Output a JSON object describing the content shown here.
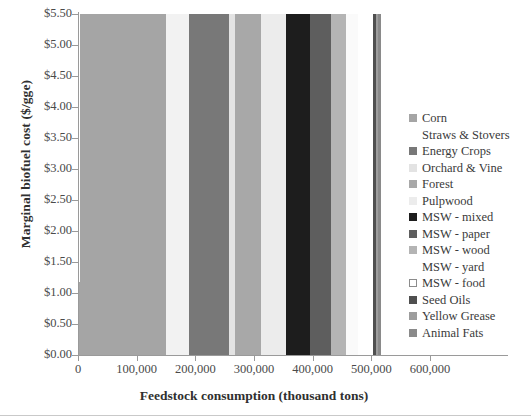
{
  "chart_data": {
    "type": "area",
    "title": "",
    "xlabel": "Feedstock consumption (thousand tons)",
    "ylabel": "Marginal biofuel cost ($/gge)",
    "xlim": [
      0,
      600000
    ],
    "ylim": [
      0.0,
      5.5
    ],
    "xticks": [
      "0",
      "100,000",
      "200,000",
      "300,000",
      "400,000",
      "500,000",
      "600,000"
    ],
    "xtick_values": [
      0,
      100000,
      200000,
      300000,
      400000,
      500000,
      600000
    ],
    "yticks": [
      "$0.00",
      "$0.50",
      "$1.00",
      "$1.50",
      "$2.00",
      "$2.50",
      "$3.00",
      "$3.50",
      "$4.00",
      "$4.50",
      "$5.00",
      "$5.50"
    ],
    "ytick_values": [
      0.0,
      0.5,
      1.0,
      1.5,
      2.0,
      2.5,
      3.0,
      3.5,
      4.0,
      4.5,
      5.0,
      5.5
    ],
    "grid": false,
    "legend_position": "right",
    "series": [
      {
        "name": "Corn",
        "color": "#a5a5a5",
        "swatch": "filled"
      },
      {
        "name": "Straws & Stovers",
        "color": "#f2f2f2",
        "swatch": "blank"
      },
      {
        "name": "Energy Crops",
        "color": "#787878",
        "swatch": "filled"
      },
      {
        "name": "Orchard & Vine",
        "color": "#e3e3e3",
        "swatch": "filled"
      },
      {
        "name": "Forest",
        "color": "#a8a8a8",
        "swatch": "filled"
      },
      {
        "name": "Pulpwood",
        "color": "#ececec",
        "swatch": "filled"
      },
      {
        "name": "MSW - mixed",
        "color": "#1d1d1d",
        "swatch": "filled"
      },
      {
        "name": "MSW - paper",
        "color": "#5e5e5e",
        "swatch": "filled"
      },
      {
        "name": "MSW - wood",
        "color": "#b4b4b4",
        "swatch": "filled"
      },
      {
        "name": "MSW - yard",
        "color": "#fafafa",
        "swatch": "blank"
      },
      {
        "name": "MSW - food",
        "color": "#ffffff",
        "swatch": "outlined"
      },
      {
        "name": "Seed Oils",
        "color": "#4f4f4f",
        "swatch": "filled"
      },
      {
        "name": "Yellow Grease",
        "color": "#9d9d9d",
        "swatch": "filled"
      },
      {
        "name": "Animal Fats",
        "color": "#8a8a8a",
        "swatch": "filled"
      }
    ],
    "bands": [
      {
        "series": "Corn",
        "x0": 1000,
        "x1": 5000,
        "y": 1.18
      },
      {
        "series": "Corn",
        "x0": 5000,
        "x1": 8000,
        "y": 1.3
      },
      {
        "series": "MSW - food",
        "x0": 8000,
        "x1": 11000,
        "y": 1.36
      },
      {
        "series": "Corn",
        "x0": 11000,
        "x1": 14000,
        "y": 1.46
      },
      {
        "series": "Corn",
        "x0": 14000,
        "x1": 17000,
        "y": 1.58
      },
      {
        "series": "Yellow Grease",
        "x0": 17000,
        "x1": 20000,
        "y": 1.7
      },
      {
        "series": "Corn",
        "x0": 20000,
        "x1": 23000,
        "y": 1.82
      },
      {
        "series": "MSW - mixed",
        "x0": 23000,
        "x1": 27000,
        "y": 1.92
      },
      {
        "series": "Animal Fats",
        "x0": 27000,
        "x1": 31000,
        "y": 2.02
      },
      {
        "series": "Corn",
        "x0": 31000,
        "x1": 36000,
        "y": 2.12
      },
      {
        "series": "Seed Oils",
        "x0": 36000,
        "x1": 41000,
        "y": 2.18
      },
      {
        "series": "MSW - wood",
        "x0": 41000,
        "x1": 47000,
        "y": 2.26
      },
      {
        "series": "MSW - mixed",
        "x0": 47000,
        "x1": 53000,
        "y": 2.32
      },
      {
        "series": "MSW - paper",
        "x0": 53000,
        "x1": 62000,
        "y": 2.38
      },
      {
        "series": "Pulpwood",
        "x0": 62000,
        "x1": 72000,
        "y": 2.44
      },
      {
        "series": "MSW - paper",
        "x0": 72000,
        "x1": 84000,
        "y": 2.5
      },
      {
        "series": "MSW - wood",
        "x0": 84000,
        "x1": 96000,
        "y": 2.54
      },
      {
        "series": "Orchard & Vine",
        "x0": 96000,
        "x1": 110000,
        "y": 2.58
      },
      {
        "series": "MSW - paper",
        "x0": 110000,
        "x1": 124000,
        "y": 2.62
      },
      {
        "series": "MSW - mixed",
        "x0": 124000,
        "x1": 138000,
        "y": 2.66
      },
      {
        "series": "Forest",
        "x0": 138000,
        "x1": 152000,
        "y": 2.7
      },
      {
        "series": "MSW - wood",
        "x0": 152000,
        "x1": 166000,
        "y": 2.74
      },
      {
        "series": "MSW - yard",
        "x0": 166000,
        "x1": 182000,
        "y": 2.78
      },
      {
        "series": "Animal Fats",
        "x0": 182000,
        "x1": 198000,
        "y": 2.82
      },
      {
        "series": "MSW - paper",
        "x0": 198000,
        "x1": 214000,
        "y": 2.86
      },
      {
        "series": "Pulpwood",
        "x0": 214000,
        "x1": 230000,
        "y": 2.9
      },
      {
        "series": "MSW - mixed",
        "x0": 230000,
        "x1": 246000,
        "y": 2.94
      },
      {
        "series": "Forest",
        "x0": 246000,
        "x1": 262000,
        "y": 2.99
      },
      {
        "series": "MSW - wood",
        "x0": 262000,
        "x1": 278000,
        "y": 3.05
      },
      {
        "series": "MSW - food",
        "x0": 278000,
        "x1": 292000,
        "y": 3.12
      },
      {
        "series": "MSW - paper",
        "x0": 292000,
        "x1": 306000,
        "y": 3.2
      },
      {
        "series": "Orchard & Vine",
        "x0": 306000,
        "x1": 320000,
        "y": 3.3
      },
      {
        "series": "MSW - mixed",
        "x0": 320000,
        "x1": 334000,
        "y": 3.42
      },
      {
        "series": "Seed Oils",
        "x0": 334000,
        "x1": 348000,
        "y": 3.56
      },
      {
        "series": "MSW - paper",
        "x0": 348000,
        "x1": 360000,
        "y": 3.72
      },
      {
        "series": "MSW - wood",
        "x0": 360000,
        "x1": 372000,
        "y": 3.88
      },
      {
        "series": "MSW - food",
        "x0": 372000,
        "x1": 383000,
        "y": 4.04
      },
      {
        "series": "MSW - mixed",
        "x0": 383000,
        "x1": 394000,
        "y": 4.2
      },
      {
        "series": "MSW - paper",
        "x0": 394000,
        "x1": 405000,
        "y": 4.36
      },
      {
        "series": "MSW - wood",
        "x0": 405000,
        "x1": 415000,
        "y": 4.52
      },
      {
        "series": "MSW - food",
        "x0": 415000,
        "x1": 424000,
        "y": 4.66
      },
      {
        "series": "MSW - mixed",
        "x0": 424000,
        "x1": 433000,
        "y": 4.8
      },
      {
        "series": "MSW - paper",
        "x0": 433000,
        "x1": 442000,
        "y": 4.92
      },
      {
        "series": "MSW - wood",
        "x0": 442000,
        "x1": 451000,
        "y": 5.04
      },
      {
        "series": "MSW - food",
        "x0": 451000,
        "x1": 460000,
        "y": 5.14
      },
      {
        "series": "MSW - mixed",
        "x0": 460000,
        "x1": 469000,
        "y": 5.24
      },
      {
        "series": "MSW - paper",
        "x0": 469000,
        "x1": 478000,
        "y": 5.32
      },
      {
        "series": "MSW - wood",
        "x0": 478000,
        "x1": 488000,
        "y": 5.4
      },
      {
        "series": "MSW - food",
        "x0": 488000,
        "x1": 498000,
        "y": 5.46
      },
      {
        "series": "Yellow Grease",
        "x0": 498000,
        "x1": 506000,
        "y": 5.49
      },
      {
        "series": "MSW - food",
        "x0": 506000,
        "x1": 514000,
        "y": 5.5
      },
      {
        "series": "Corn",
        "x0": 3000,
        "x1": 150000,
        "y": 5.5
      },
      {
        "series": "Straws & Stovers",
        "x0": 150000,
        "x1": 190000,
        "y": 5.5
      },
      {
        "series": "Energy Crops",
        "x0": 190000,
        "x1": 258000,
        "y": 5.5
      },
      {
        "series": "Orchard & Vine",
        "x0": 258000,
        "x1": 268000,
        "y": 5.5
      },
      {
        "series": "Forest",
        "x0": 268000,
        "x1": 312000,
        "y": 5.5
      },
      {
        "series": "Pulpwood",
        "x0": 312000,
        "x1": 354000,
        "y": 5.5
      },
      {
        "series": "MSW - mixed",
        "x0": 354000,
        "x1": 396000,
        "y": 5.5
      },
      {
        "series": "MSW - paper",
        "x0": 396000,
        "x1": 432000,
        "y": 5.5
      },
      {
        "series": "MSW - wood",
        "x0": 432000,
        "x1": 456000,
        "y": 5.5
      },
      {
        "series": "MSW - yard",
        "x0": 456000,
        "x1": 478000,
        "y": 5.5
      },
      {
        "series": "MSW - food",
        "x0": 478000,
        "x1": 502000,
        "y": 5.5
      },
      {
        "series": "Seed Oils",
        "x0": 502000,
        "x1": 508000,
        "y": 5.5
      },
      {
        "series": "Yellow Grease",
        "x0": 508000,
        "x1": 512000,
        "y": 5.5
      },
      {
        "series": "Animal Fats",
        "x0": 512000,
        "x1": 516000,
        "y": 5.5
      }
    ]
  }
}
